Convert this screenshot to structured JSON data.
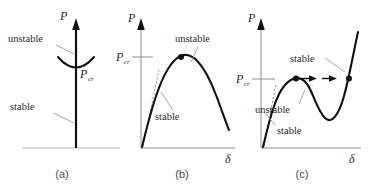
{
  "figure": {
    "type": "stability-bifurcation-diagrams",
    "panel_count": 3,
    "axis_labels": {
      "load": "P",
      "deflection": "δ",
      "critical_load": "P",
      "critical_sub": "cr"
    },
    "colors": {
      "curve": "#111111",
      "axis": "#8d8d8d",
      "leader": "#9a9a9a",
      "dotted": "#8a8a8a",
      "caption": "#4a4a4a",
      "background": "#ffffff"
    }
  },
  "panels": [
    {
      "id": "a",
      "caption": "(a)",
      "description": "Vertical equilibrium path with neutral bifurcation at critical load",
      "axis": {
        "vertical_label": "P",
        "has_arrow": true,
        "has_baseline": true
      },
      "critical_label": {
        "main": "P",
        "sub": "cr"
      },
      "annotations": [
        {
          "name": "unstable",
          "text": "unstable",
          "x": 8,
          "y": 42
        },
        {
          "name": "stable",
          "text": "stable",
          "x": 8,
          "y": 107
        }
      ]
    },
    {
      "id": "b",
      "caption": "(b)",
      "description": "Limit-point buckling: rising stable branch to a peak, then falling unstable branch",
      "axis": {
        "vertical_label": "P",
        "horizontal_label": "δ",
        "has_arrow": true
      },
      "critical_label": {
        "main": "P",
        "sub": "cr"
      },
      "annotations": [
        {
          "name": "unstable",
          "text": "unstable",
          "x": 62,
          "y": 42
        },
        {
          "name": "stable",
          "text": "stable",
          "x": 40,
          "y": 118
        }
      ],
      "markers": [
        {
          "name": "peak-point",
          "role": "limit point at P_cr"
        }
      ]
    },
    {
      "id": "c",
      "caption": "(c)",
      "description": "Snap-through response: local maximum, unstable descending branch, local minimum, then restabilized rising branch with jump arrows",
      "axis": {
        "vertical_label": "P",
        "horizontal_label": "δ",
        "has_arrow": true
      },
      "critical_label": {
        "main": "P",
        "sub": "cr"
      },
      "annotations": [
        {
          "name": "stable-upper",
          "text": "stable",
          "x": 57,
          "y": 60
        },
        {
          "name": "unstable",
          "text": "unstable",
          "x": 22,
          "y": 110
        },
        {
          "name": "stable-lower",
          "text": "stable",
          "x": 42,
          "y": 133
        }
      ],
      "markers": [
        {
          "name": "snap-start-point",
          "role": "local maximum at P_cr"
        },
        {
          "name": "snap-end-point",
          "role": "restabilized point at P_cr"
        }
      ],
      "arrows": {
        "name": "snap-through-arrows",
        "count": 3,
        "direction": "right"
      }
    }
  ]
}
